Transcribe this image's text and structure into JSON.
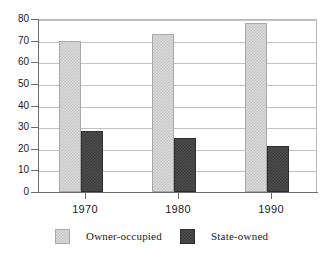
{
  "chart_data": {
    "type": "bar",
    "title": "",
    "subtitle": "",
    "xlabel": "",
    "ylabel": "",
    "categories": [
      "1970",
      "1980",
      "1990"
    ],
    "series": [
      {
        "name": "Owner-occupied",
        "values": [
          70,
          73,
          78
        ],
        "color": "#d9d9d9"
      },
      {
        "name": "State-owned",
        "values": [
          28,
          25,
          21.5
        ],
        "color": "#4d4d4d"
      }
    ],
    "ylim": [
      0,
      80
    ],
    "ytick_step": 10,
    "yticks": [
      "0",
      "10",
      "20",
      "30",
      "40",
      "50",
      "60",
      "70",
      "80"
    ],
    "grid": true,
    "grid_axis": "y",
    "legend_position": "bottom",
    "annotations": []
  },
  "axes": {
    "y": {
      "ticks": [
        {
          "label": "80",
          "value": 80
        },
        {
          "label": "70",
          "value": 70
        },
        {
          "label": "60",
          "value": 60
        },
        {
          "label": "50",
          "value": 50
        },
        {
          "label": "40",
          "value": 40
        },
        {
          "label": "30",
          "value": 30
        },
        {
          "label": "20",
          "value": 20
        },
        {
          "label": "10",
          "value": 10
        },
        {
          "label": "0",
          "value": 0
        }
      ]
    },
    "x": {
      "ticks": [
        {
          "label": "1970"
        },
        {
          "label": "1980"
        },
        {
          "label": "1990"
        }
      ]
    }
  },
  "legend": {
    "items": [
      {
        "label": "Owner-occupied",
        "swatch": "light-gray-checker"
      },
      {
        "label": "State-owned",
        "swatch": "dark-gray-checker"
      }
    ]
  },
  "colors": {
    "light_bar": "#d9d9d9",
    "dark_bar": "#4d4d4d",
    "axis": "#6b6b6b",
    "grid": "#c2c2c2",
    "text": "#1a1a1a",
    "background": "#ffffff"
  }
}
